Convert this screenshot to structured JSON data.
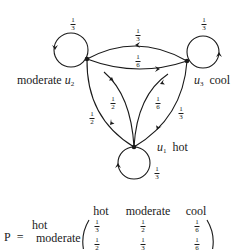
{
  "nodes": {
    "moderate": {
      "name": "moderate",
      "symbol": "u",
      "index": "2"
    },
    "cool": {
      "name": "cool",
      "symbol": "u",
      "index": "3"
    },
    "hot": {
      "name": "hot",
      "symbol": "u",
      "index": "1"
    }
  },
  "edges": {
    "moderate_self": {
      "num": "1",
      "den": "3"
    },
    "cool_self": {
      "num": "1",
      "den": "3"
    },
    "hot_self": {
      "num": "1",
      "den": "3"
    },
    "cool_to_moderate": {
      "num": "1",
      "den": "3"
    },
    "moderate_to_cool": {
      "num": "1",
      "den": "6"
    },
    "hot_to_moderate": {
      "num": "1",
      "den": "2"
    },
    "moderate_to_hot": {
      "num": "1",
      "den": "2"
    },
    "hot_to_cool": {
      "num": "1",
      "den": "6"
    },
    "cool_to_hot": {
      "num": "1",
      "den": "3"
    }
  },
  "matrix": {
    "label": "P",
    "equals": "=",
    "col_headers": [
      "hot",
      "moderate",
      "cool"
    ],
    "row_headers": [
      "hot",
      "moderate"
    ],
    "rows": [
      [
        {
          "num": "1",
          "den": "3"
        },
        {
          "num": "1",
          "den": "2"
        },
        {
          "num": "1",
          "den": "6"
        }
      ],
      [
        {
          "num": "1",
          "den": "2"
        },
        {
          "num": "1",
          "den": "3"
        },
        {
          "num": "1",
          "den": "6"
        }
      ]
    ]
  },
  "colors": {
    "ink": "#1a1a1a",
    "background": "#ffffff"
  }
}
